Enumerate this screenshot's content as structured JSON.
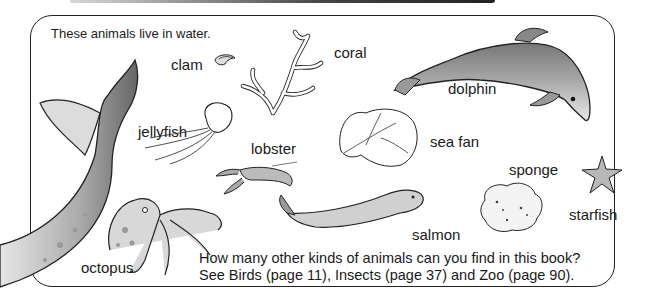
{
  "page": {
    "intro": "These animals live in water.",
    "question_line1": "How many other kinds of animals can you find in this book?",
    "question_line2": "See Birds (page 11), Insects (page 37) and Zoo (page 90)."
  },
  "animals": [
    {
      "id": "clam",
      "label": "clam"
    },
    {
      "id": "coral",
      "label": "coral"
    },
    {
      "id": "dolphin",
      "label": "dolphin"
    },
    {
      "id": "jellyfish",
      "label": "jellyfish"
    },
    {
      "id": "lobster",
      "label": "lobster"
    },
    {
      "id": "sea-fan",
      "label": "sea fan"
    },
    {
      "id": "sponge",
      "label": "sponge"
    },
    {
      "id": "starfish",
      "label": "starfish"
    },
    {
      "id": "salmon",
      "label": "salmon"
    },
    {
      "id": "octopus",
      "label": "octopus"
    }
  ],
  "colors": {
    "ink": "#1a1a1a",
    "shade": "#8c8c8c",
    "paper": "#ffffff"
  }
}
